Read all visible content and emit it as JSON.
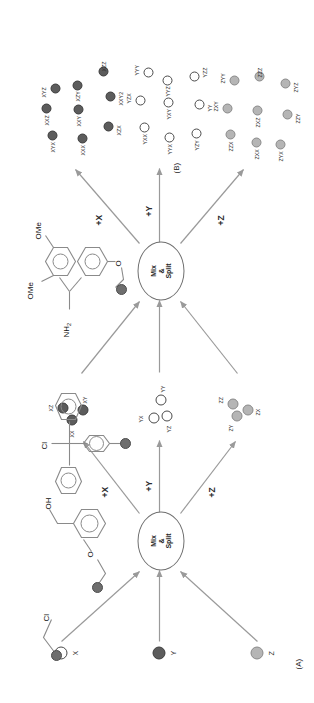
{
  "figure": {
    "panels": [
      {
        "id": "A",
        "label": "(A)"
      },
      {
        "id": "B",
        "label": "(B)"
      }
    ]
  },
  "panelA": {
    "node_label_line1": "Mix",
    "node_label_line2": "&",
    "node_label_line3": "Split",
    "nodes": [
      {
        "name": "mix-split-round-1"
      },
      {
        "name": "mix-split-round-2"
      }
    ],
    "starting_materials": [
      {
        "label": "X",
        "color": "#ffffff",
        "type": "open"
      },
      {
        "label": "Y",
        "color": "#5c5c5c",
        "type": "dark"
      },
      {
        "label": "Z",
        "color": "#b5b5b5",
        "type": "grey"
      }
    ],
    "reaction_labels_round1": [
      "+X",
      "+Y",
      "+Z"
    ],
    "reaction_labels_round2": [
      "+X",
      "+Y",
      "+Z"
    ],
    "intermediates": [
      {
        "set": "X-branch",
        "type": "dark",
        "labels": [
          "XX",
          "XZ",
          "XY"
        ]
      },
      {
        "set": "Y-branch",
        "type": "open",
        "labels": [
          "YX",
          "YY",
          "YZ"
        ]
      },
      {
        "set": "Z-branch",
        "type": "grey",
        "labels": [
          "ZY",
          "ZZ",
          "ZX"
        ]
      }
    ],
    "products": [
      {
        "set": "X-products",
        "type": "dark",
        "labels": [
          "XYX",
          "XXZ",
          "XYZ",
          "XXX",
          "XXY",
          "XZY",
          "XZX",
          "XXY2",
          "XZZ"
        ]
      },
      {
        "set": "Y-products",
        "type": "open",
        "labels": [
          "YXX",
          "YZX",
          "YYY",
          "YYX",
          "YXY",
          "YYZ",
          "YZY",
          "YY",
          "YZZ"
        ]
      },
      {
        "set": "Z-products",
        "type": "grey",
        "labels": [
          "ZZX",
          "ZXY",
          "ZYY",
          "ZXX",
          "ZXZ",
          "ZZZ",
          "ZYX",
          "ZZY",
          "ZYZ"
        ]
      }
    ]
  },
  "panelB": {
    "structures": [
      {
        "name": "merrifield-resin",
        "atoms": [
          "Cl"
        ]
      },
      {
        "name": "wang-resin",
        "atoms": [
          "OH",
          "O"
        ]
      },
      {
        "name": "trityl-chloride-resin",
        "atoms": [
          "Cl"
        ]
      },
      {
        "name": "rink-amide-resin",
        "atoms": [
          "NH2",
          "OMe",
          "OMe",
          "O"
        ]
      }
    ],
    "labels": {
      "cl_1": "Cl",
      "oh": "OH",
      "o_wang": "O",
      "cl_trityl": "Cl",
      "nh2": "NH",
      "nh2_sub": "2",
      "ome_1": "OMe",
      "ome_2": "OMe",
      "o_rink": "O"
    }
  },
  "colors": {
    "bead_open": "#ffffff",
    "bead_dark": "#5c5c5c",
    "bead_grey": "#b5b5b5",
    "stroke": "#8a8a8a",
    "text": "#1d1d1d"
  }
}
